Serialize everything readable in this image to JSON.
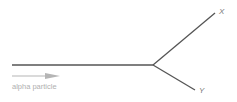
{
  "diagram": {
    "caption": "alpha particle",
    "labels": {
      "x": "X",
      "y": "Y"
    },
    "colors": {
      "track": "#555555",
      "arrow": "#b5b5b5",
      "text": "#7a7a7a"
    }
  }
}
